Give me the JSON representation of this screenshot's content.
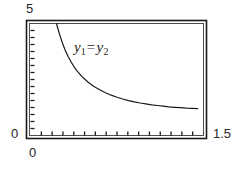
{
  "figure": {
    "background_color": "#ffffff",
    "ink_color": "#1a1a1a",
    "annotation": {
      "lhs_var": "y",
      "lhs_sub": "1",
      "operator": "=",
      "rhs_var": "y",
      "rhs_sub": "2",
      "full_text": "y1 = y2"
    }
  },
  "chart_data": {
    "type": "line",
    "title": "",
    "subtitle": "",
    "xlabel": "",
    "ylabel": "",
    "xlim": [
      0,
      1.5
    ],
    "ylim": [
      0,
      5
    ],
    "grid": false,
    "legend": null,
    "frame": "box",
    "x_tick_labels": [
      "0",
      "1.5"
    ],
    "y_tick_labels": [
      "0",
      "5"
    ],
    "x_minor_tick_count": 15,
    "y_minor_tick_count": 15,
    "annotations": [
      {
        "text": "y1 = y2",
        "x": 0.62,
        "y": 3.75
      }
    ],
    "series": [
      {
        "name": "y1 = y2",
        "color": "#1a1a1a",
        "line_width": 1.2,
        "description": "decreasing hyperbolic curve, clipped at top of frame",
        "x": [
          0.225,
          0.25,
          0.275,
          0.3,
          0.325,
          0.35,
          0.375,
          0.4,
          0.45,
          0.5,
          0.55,
          0.6,
          0.65,
          0.7,
          0.75,
          0.8,
          0.85,
          0.9,
          0.95,
          1.0,
          1.05,
          1.1,
          1.15,
          1.2,
          1.25,
          1.3,
          1.35,
          1.4,
          1.45
        ],
        "y": [
          5.0,
          4.55,
          4.15,
          3.82,
          3.54,
          3.3,
          3.09,
          2.91,
          2.61,
          2.38,
          2.19,
          2.04,
          1.91,
          1.8,
          1.71,
          1.63,
          1.56,
          1.5,
          1.45,
          1.41,
          1.37,
          1.34,
          1.31,
          1.28,
          1.26,
          1.24,
          1.22,
          1.21,
          1.2
        ]
      }
    ]
  },
  "labels": {
    "y_max": "5",
    "y_min": "0",
    "x_min": "0",
    "x_max": "1.5"
  }
}
